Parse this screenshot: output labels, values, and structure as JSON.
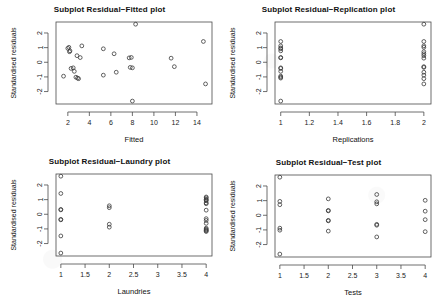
{
  "page": {
    "watermark_text": "Subplot Residual plots"
  },
  "chart_data": [
    {
      "type": "scatter",
      "title": "Subplot Residual−Fitted plot",
      "xlabel": "Fitted",
      "ylabel": "Standardised residuals",
      "xlim": [
        0.9,
        15.4
      ],
      "ylim": [
        -2.85,
        2.75
      ],
      "xticks": [
        2,
        4,
        6,
        8,
        10,
        12,
        14
      ],
      "yticks": [
        2,
        1,
        0,
        -1,
        -2
      ],
      "grid": false,
      "marker": "open-circle",
      "points": [
        {
          "x": 1.6,
          "y": -0.95
        },
        {
          "x": 2.0,
          "y": 0.95
        },
        {
          "x": 2.1,
          "y": 1.02
        },
        {
          "x": 2.15,
          "y": 0.72
        },
        {
          "x": 2.2,
          "y": 0.78
        },
        {
          "x": 2.3,
          "y": -0.42
        },
        {
          "x": 2.5,
          "y": -0.38
        },
        {
          "x": 2.6,
          "y": -0.62
        },
        {
          "x": 2.75,
          "y": -1.02
        },
        {
          "x": 2.9,
          "y": -1.08
        },
        {
          "x": 3.0,
          "y": -1.12
        },
        {
          "x": 2.85,
          "y": 0.45
        },
        {
          "x": 3.15,
          "y": 0.32
        },
        {
          "x": 3.3,
          "y": 1.12
        },
        {
          "x": 5.3,
          "y": -0.88
        },
        {
          "x": 5.3,
          "y": 0.92
        },
        {
          "x": 6.3,
          "y": 0.58
        },
        {
          "x": 6.5,
          "y": -0.68
        },
        {
          "x": 7.7,
          "y": 0.3
        },
        {
          "x": 7.9,
          "y": 0.33
        },
        {
          "x": 7.8,
          "y": -0.35
        },
        {
          "x": 8.0,
          "y": -0.38
        },
        {
          "x": 8.0,
          "y": -2.65
        },
        {
          "x": 8.3,
          "y": 2.6
        },
        {
          "x": 11.6,
          "y": 0.28
        },
        {
          "x": 11.9,
          "y": -0.3
        },
        {
          "x": 14.6,
          "y": 1.42
        },
        {
          "x": 14.8,
          "y": -1.48
        }
      ]
    },
    {
      "type": "scatter",
      "title": "Subplot Residual−Replication plot",
      "xlabel": "Replications",
      "ylabel": "Standardised residuals",
      "xlim": [
        0.96,
        2.05
      ],
      "ylim": [
        -2.85,
        2.75
      ],
      "xticks": [
        1.0,
        1.2,
        1.4,
        1.6,
        1.8,
        2.0
      ],
      "yticks": [
        2,
        1,
        0,
        -1,
        -2
      ],
      "grid": false,
      "marker": "open-circle",
      "points": [
        {
          "x": 1.0,
          "y": 1.42
        },
        {
          "x": 1.0,
          "y": 1.12
        },
        {
          "x": 1.0,
          "y": 0.98
        },
        {
          "x": 1.0,
          "y": 0.92
        },
        {
          "x": 1.0,
          "y": 0.78
        },
        {
          "x": 1.0,
          "y": 0.3
        },
        {
          "x": 1.0,
          "y": 0.33
        },
        {
          "x": 1.0,
          "y": -0.38
        },
        {
          "x": 1.0,
          "y": -0.42
        },
        {
          "x": 1.0,
          "y": -0.62
        },
        {
          "x": 1.0,
          "y": -0.95
        },
        {
          "x": 1.0,
          "y": -1.02
        },
        {
          "x": 1.0,
          "y": -1.08
        },
        {
          "x": 1.0,
          "y": -2.65
        },
        {
          "x": 2.0,
          "y": 2.6
        },
        {
          "x": 2.0,
          "y": 1.12
        },
        {
          "x": 2.0,
          "y": 1.02
        },
        {
          "x": 2.0,
          "y": 0.58
        },
        {
          "x": 2.0,
          "y": 0.45
        },
        {
          "x": 2.0,
          "y": -0.3
        },
        {
          "x": 2.0,
          "y": -0.35
        },
        {
          "x": 2.0,
          "y": -0.68
        },
        {
          "x": 2.0,
          "y": -0.88
        },
        {
          "x": 2.0,
          "y": -1.12
        },
        {
          "x": 2.0,
          "y": -1.48
        },
        {
          "x": 2.0,
          "y": 0.28
        },
        {
          "x": 2.0,
          "y": 0.72
        },
        {
          "x": 2.0,
          "y": 1.42
        }
      ]
    },
    {
      "type": "scatter",
      "title": "Subplot Residual−Laundry plot",
      "xlabel": "Laundries",
      "ylabel": "Standardised residuals",
      "xlim": [
        0.9,
        4.12
      ],
      "ylim": [
        -2.85,
        2.75
      ],
      "xticks": [
        1.0,
        1.5,
        2.0,
        2.5,
        3.0,
        3.5,
        4.0
      ],
      "yticks": [
        2,
        1,
        0,
        -1,
        -2
      ],
      "grid": false,
      "marker": "open-circle",
      "points": [
        {
          "x": 1.0,
          "y": 2.6
        },
        {
          "x": 1.0,
          "y": 1.42
        },
        {
          "x": 1.0,
          "y": 0.33
        },
        {
          "x": 1.0,
          "y": 0.3
        },
        {
          "x": 1.0,
          "y": -0.35
        },
        {
          "x": 1.0,
          "y": -0.38
        },
        {
          "x": 1.0,
          "y": -1.48
        },
        {
          "x": 1.0,
          "y": -2.65
        },
        {
          "x": 2.0,
          "y": 0.58
        },
        {
          "x": 2.0,
          "y": 0.45
        },
        {
          "x": 2.0,
          "y": -0.68
        },
        {
          "x": 2.0,
          "y": -0.88
        },
        {
          "x": 4.0,
          "y": 1.12
        },
        {
          "x": 4.0,
          "y": 1.02
        },
        {
          "x": 4.0,
          "y": 0.98
        },
        {
          "x": 4.0,
          "y": 0.92
        },
        {
          "x": 4.0,
          "y": 0.78
        },
        {
          "x": 4.0,
          "y": 0.72
        },
        {
          "x": 4.0,
          "y": -0.95
        },
        {
          "x": 4.0,
          "y": -1.02
        },
        {
          "x": 4.0,
          "y": -1.08
        },
        {
          "x": 4.0,
          "y": -1.12
        },
        {
          "x": 4.0,
          "y": -0.62
        },
        {
          "x": 4.0,
          "y": -0.42
        },
        {
          "x": 4.0,
          "y": 1.18
        },
        {
          "x": 4.0,
          "y": -1.18
        },
        {
          "x": 4.0,
          "y": 0.28
        },
        {
          "x": 4.0,
          "y": -0.3
        }
      ]
    },
    {
      "type": "scatter",
      "title": "Subplot Residual−Test plot",
      "xlabel": "Tests",
      "ylabel": "Standardised residuals",
      "xlim": [
        0.9,
        4.12
      ],
      "ylim": [
        -2.85,
        2.75
      ],
      "xticks": [
        1.0,
        1.5,
        2.0,
        2.5,
        3.0,
        3.5,
        4.0
      ],
      "yticks": [
        2,
        1,
        0,
        -1,
        -2
      ],
      "grid": false,
      "marker": "open-circle",
      "points": [
        {
          "x": 1.0,
          "y": 2.6
        },
        {
          "x": 1.0,
          "y": 0.95
        },
        {
          "x": 1.0,
          "y": 0.72
        },
        {
          "x": 1.0,
          "y": -0.88
        },
        {
          "x": 1.0,
          "y": -1.02
        },
        {
          "x": 1.0,
          "y": -2.65
        },
        {
          "x": 2.0,
          "y": 1.12
        },
        {
          "x": 2.0,
          "y": 0.3
        },
        {
          "x": 2.0,
          "y": 0.33
        },
        {
          "x": 2.0,
          "y": -0.35
        },
        {
          "x": 2.0,
          "y": -0.38
        },
        {
          "x": 2.0,
          "y": -1.08
        },
        {
          "x": 3.0,
          "y": 1.42
        },
        {
          "x": 3.0,
          "y": 0.92
        },
        {
          "x": 3.0,
          "y": 0.78
        },
        {
          "x": 3.0,
          "y": -0.62
        },
        {
          "x": 3.0,
          "y": -0.68
        },
        {
          "x": 3.0,
          "y": -1.48
        },
        {
          "x": 4.0,
          "y": 1.02
        },
        {
          "x": 4.0,
          "y": 0.28
        },
        {
          "x": 4.0,
          "y": -0.3
        },
        {
          "x": 4.0,
          "y": -1.12
        }
      ]
    }
  ]
}
